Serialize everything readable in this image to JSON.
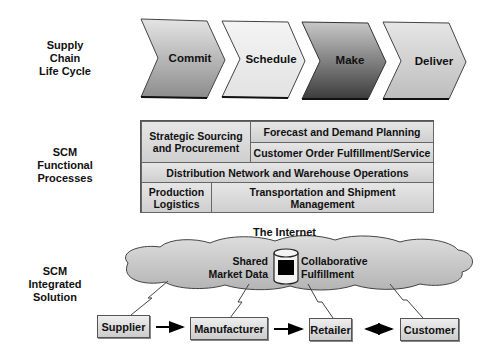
{
  "row_labels": {
    "lifecycle": [
      "Supply",
      "Chain",
      "Life Cycle"
    ],
    "functional": [
      "SCM",
      "Functional",
      "Processes"
    ],
    "integrated": [
      "SCM",
      "Integrated",
      "Solution"
    ]
  },
  "lifecycle_stages": [
    {
      "label": "Commit",
      "shade": "mid-gradient"
    },
    {
      "label": "Schedule",
      "shade": "light"
    },
    {
      "label": "Make",
      "shade": "dark-gradient"
    },
    {
      "label": "Deliver",
      "shade": "light-gradient"
    }
  ],
  "functional_processes": {
    "strategic_sourcing": [
      "Strategic Sourcing",
      "and Procurement"
    ],
    "forecast": "Forecast and Demand Planning",
    "customer_order": "Customer Order Fulfillment/Service",
    "distribution": "Distribution Network and Warehouse Operations",
    "production": [
      "Production",
      "Logistics"
    ],
    "transportation": [
      "Transportation and Shipment",
      "Management"
    ]
  },
  "integrated_solution": {
    "network_title": "The Internet",
    "shared_data": [
      "Shared",
      "Market Data"
    ],
    "collaborative": [
      "Collaborative",
      "Fulfillment"
    ],
    "icon": "database-icon"
  },
  "entities": [
    "Supplier",
    "Manufacturer",
    "Retailer",
    "Customer"
  ],
  "flows": [
    {
      "from": "Supplier",
      "to": "Manufacturer",
      "direction": "one-way"
    },
    {
      "from": "Manufacturer",
      "to": "Retailer",
      "direction": "one-way"
    },
    {
      "from": "Retailer",
      "to": "Customer",
      "direction": "two-way"
    }
  ]
}
